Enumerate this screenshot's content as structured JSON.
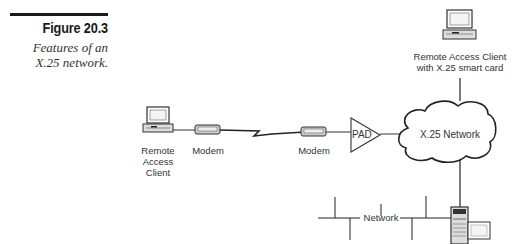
{
  "figure": {
    "number": "Figure 20.3",
    "caption_line1": "Features of an",
    "caption_line2": "X.25 network."
  },
  "diagram": {
    "nodes": {
      "remote_client": {
        "line1": "Remote",
        "line2": "Access",
        "line3": "Client"
      },
      "modem_left": "Modem",
      "modem_right": "Modem",
      "pad": "PAD",
      "x25_network": "X.25 Network",
      "smart_card_client": {
        "line1": "Remote Access Client",
        "line2": "with X.25 smart card"
      },
      "network": "Network"
    },
    "connections": [
      "Remote Access Client - Modem",
      "Modem - Modem (serial/phone link)",
      "Modem - PAD",
      "PAD - X.25 Network",
      "X.25 Network - Remote Access Client with X.25 smart card",
      "X.25 Network - Server on Network"
    ]
  }
}
